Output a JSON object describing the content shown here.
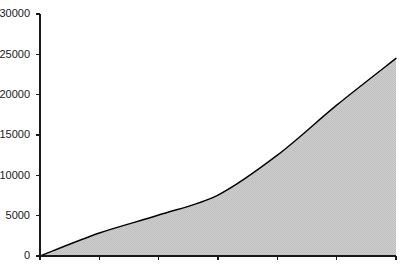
{
  "chart_data": {
    "type": "area",
    "title": "",
    "subtitle": "",
    "xlabel": "",
    "ylabel": "",
    "x": [
      0,
      1,
      2,
      3,
      4,
      5,
      6
    ],
    "categories": [
      "",
      "",
      "",
      "",
      "",
      "",
      ""
    ],
    "values": [
      0,
      2850,
      5080,
      7560,
      12500,
      18700,
      24500
    ],
    "series": [
      {
        "name": "",
        "values": [
          0,
          2850,
          5080,
          7560,
          12500,
          18700,
          24500
        ]
      }
    ],
    "ylim": [
      0,
      30000
    ],
    "xlim": [
      0,
      6
    ],
    "ytick_values": [
      0,
      5000,
      10000,
      15000,
      20000,
      25000,
      30000
    ],
    "ytick_labels": [
      "0",
      "5000",
      "10000",
      "15000",
      "20000",
      "25000",
      "30000"
    ],
    "xtick_labels": [
      "",
      "",
      "",
      "",
      "",
      "",
      ""
    ],
    "grid": false,
    "legend": false,
    "legend_position": "none",
    "fill_color": "#c8c8c8",
    "line_color": "#000000",
    "axis_color": "#1a1a1a",
    "background_color": "#ffffff",
    "annotations": []
  },
  "layout": {
    "width": 415,
    "height": 266,
    "plot_left": 40,
    "plot_right": 396,
    "plot_top": 14,
    "plot_bottom": 256,
    "tick_length": 4,
    "ylabel_gap": 6
  }
}
